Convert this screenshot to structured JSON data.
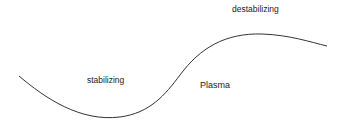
{
  "diagram": {
    "labels": {
      "destabilizing": "destabilizing",
      "stabilizing": "stabilizing",
      "plasma": "Plasma"
    },
    "curve": {
      "stroke": "#333333",
      "points": [
        [
          19,
          76
        ],
        [
          110,
          118
        ],
        [
          180,
          75
        ],
        [
          262,
          34
        ],
        [
          327,
          46
        ]
      ]
    }
  }
}
